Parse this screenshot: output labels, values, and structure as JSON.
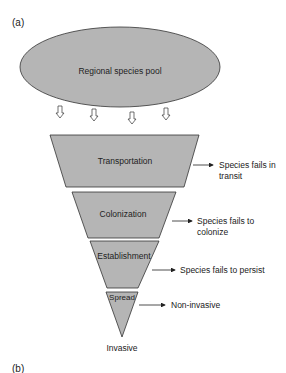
{
  "panel_labels": {
    "a": "(a)",
    "b": "(b)"
  },
  "pool": {
    "label": "Regional species pool"
  },
  "stages": [
    {
      "label": "Transportation",
      "outcome_line1": "Species fails in",
      "outcome_line2": "transit"
    },
    {
      "label": "Colonization",
      "outcome_line1": "Species fails to",
      "outcome_line2": "colonize"
    },
    {
      "label": "Establishment",
      "outcome_line1": "Species fails to persist",
      "outcome_line2": ""
    },
    {
      "label": "Spread",
      "outcome_line1": "Non-invasive",
      "outcome_line2": ""
    }
  ],
  "final": {
    "label": "Invasive"
  },
  "colors": {
    "fill": "#b5b5b5",
    "stroke": "#333333",
    "text": "#222222"
  }
}
